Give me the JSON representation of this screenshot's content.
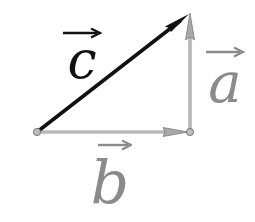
{
  "diagram": {
    "title": "",
    "points": {
      "origin": {
        "x": 37,
        "y": 132
      },
      "corner": {
        "x": 190,
        "y": 132
      },
      "apex": {
        "x": 190,
        "y": 13
      }
    },
    "vectors": [
      {
        "name": "c",
        "label": "c",
        "from": "origin",
        "to": "apex",
        "color": "#111111",
        "width": 3.5
      },
      {
        "name": "b",
        "label": "b",
        "from": "origin",
        "to": "corner",
        "color": "#9a9a9a",
        "width": 3
      },
      {
        "name": "a",
        "label": "a",
        "from": "corner",
        "to": "apex",
        "color": "#9a9a9a",
        "width": 3
      }
    ],
    "labels": {
      "c": "c",
      "a": "a",
      "b": "b"
    },
    "colors": {
      "dark_vector": "#111111",
      "light_vector": "#9a9a9a",
      "light_label": "#8a8a8a",
      "point_fill": "#bdbdbd",
      "point_stroke": "#7a7a7a"
    }
  }
}
